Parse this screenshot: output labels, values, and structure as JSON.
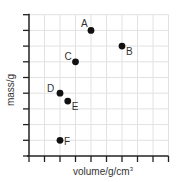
{
  "chart_data": {
    "type": "scatter",
    "title": "",
    "xlabel": "volume/g/cm³",
    "ylabel": "mass/g",
    "xlim": [
      0,
      9
    ],
    "ylim": [
      0,
      9
    ],
    "grid": true,
    "tick_labels_shown": false,
    "legend": null,
    "points": [
      {
        "label": "A",
        "x": 4,
        "y": 8
      },
      {
        "label": "B",
        "x": 6,
        "y": 7
      },
      {
        "label": "C",
        "x": 3,
        "y": 6
      },
      {
        "label": "D",
        "x": 2,
        "y": 4
      },
      {
        "label": "E",
        "x": 2.5,
        "y": 3.5
      },
      {
        "label": "F",
        "x": 2,
        "y": 1
      }
    ]
  },
  "axes": {
    "x_label": "volume/g/cm",
    "x_label_sup": "3",
    "y_label": "mass/g"
  }
}
